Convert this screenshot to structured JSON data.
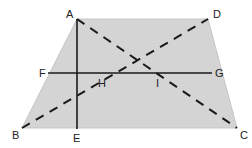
{
  "diagram": {
    "type": "geometry",
    "shape": "trapezoid",
    "fill_color": "#d4d4d4",
    "line_color": "#1a1a1a",
    "vertices": {
      "A": {
        "x": 77,
        "y": 19
      },
      "D": {
        "x": 208,
        "y": 19
      },
      "C": {
        "x": 237,
        "y": 128
      },
      "B": {
        "x": 22,
        "y": 128
      }
    },
    "labels": {
      "A": "A",
      "B": "B",
      "C": "C",
      "D": "D",
      "E": "E",
      "F": "F",
      "G": "G",
      "H": "H",
      "I": "I"
    },
    "segments": [
      {
        "name": "AE",
        "style": "solid",
        "description": "altitude from A to base BC at E"
      },
      {
        "name": "FG",
        "style": "solid",
        "description": "midline parallel to bases"
      },
      {
        "name": "AC",
        "style": "dashed",
        "description": "diagonal"
      },
      {
        "name": "BD",
        "style": "dashed",
        "description": "diagonal"
      }
    ]
  }
}
